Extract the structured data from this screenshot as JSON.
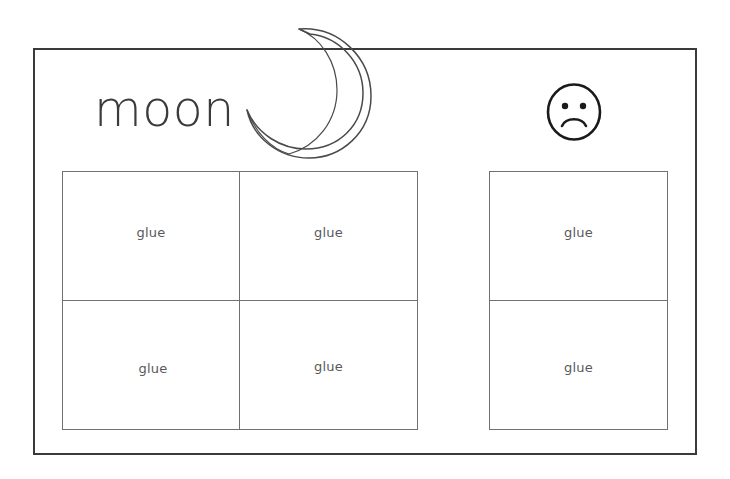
{
  "page": {
    "background_color": "#ffffff",
    "frame": {
      "stroke_color": "#3a3a3c",
      "stroke_width": 2
    }
  },
  "heading": {
    "word": "moon"
  },
  "illustrations": [
    {
      "icon": "crescent-moon-icon",
      "stroke_color": "#4a4a4c",
      "description": "crescent moon outline"
    },
    {
      "icon": "sad-face-icon",
      "stroke_color": "#1a1a1a",
      "description": "frowning face outline"
    }
  ],
  "left_grid": {
    "columns": 2,
    "rows": 2,
    "border_color": "#6f7072",
    "cells": [
      {
        "label": "glue"
      },
      {
        "label": "glue"
      },
      {
        "label": "glue"
      },
      {
        "label": "glue"
      }
    ]
  },
  "right_grid": {
    "columns": 1,
    "rows": 2,
    "border_color": "#6f7072",
    "cells": [
      {
        "label": "glue"
      },
      {
        "label": "glue"
      }
    ]
  }
}
